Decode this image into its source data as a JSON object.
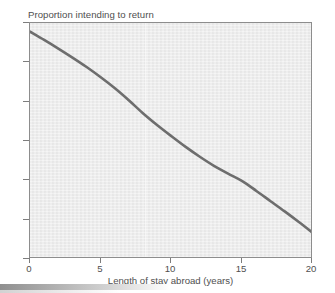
{
  "chart_data": {
    "type": "line",
    "title": "Proportion intending to return",
    "xlabel": "Length of stay abroad (years)",
    "ylabel": "Proportion intending to return",
    "xlim": [
      0,
      20
    ],
    "ylim": [
      0.3,
      0.9
    ],
    "xticks": [
      "0",
      "5",
      "10",
      "15",
      "20"
    ],
    "xtick_values": [
      0,
      5,
      10,
      15,
      20
    ],
    "yticks": [
      ".9",
      ".8",
      ".7",
      ".6",
      ".5",
      ".4",
      ".3"
    ],
    "ytick_values": [
      0.9,
      0.8,
      0.7,
      0.6,
      0.5,
      0.4,
      0.3
    ],
    "grid": false,
    "legend": "none",
    "series": [
      {
        "name": "Proportion intending to return",
        "color": "#6d6d6d",
        "line_width": 2.6,
        "x": [
          0,
          1,
          2,
          3,
          4,
          5,
          6,
          7,
          8,
          9,
          10,
          11,
          12,
          13,
          14,
          15,
          16,
          17,
          18,
          19,
          20
        ],
        "values": [
          0.878,
          0.857,
          0.835,
          0.812,
          0.788,
          0.762,
          0.734,
          0.703,
          0.67,
          0.64,
          0.612,
          0.585,
          0.56,
          0.537,
          0.517,
          0.498,
          0.473,
          0.447,
          0.421,
          0.394,
          0.366
        ]
      }
    ]
  },
  "figure": {
    "background_color": "#ffffff",
    "plot_background_color": "#ededed",
    "axis_color": "#8d8d8d",
    "text_color": "#4f4f4f"
  }
}
